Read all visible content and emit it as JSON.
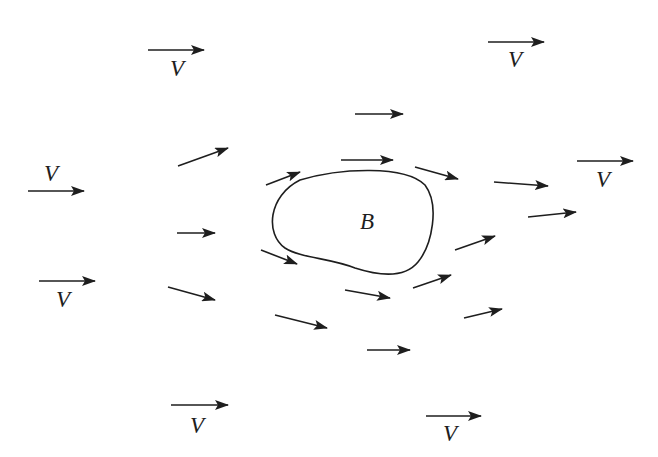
{
  "diagram": {
    "body_label": "B",
    "body_label_pos": [
      367,
      221
    ],
    "body_path": "M 300 180 C 340 168, 405 165, 425 185 C 440 205, 432 245, 418 262 C 405 278, 380 276, 355 268 C 330 258, 300 258, 285 248 C 265 234, 268 196, 300 180 Z",
    "colors": {
      "stroke": "#1e1e1e",
      "background": "#ffffff"
    },
    "free_stream_label": "V",
    "free_stream_vectors": [
      {
        "x1": 148,
        "y1": 50,
        "x2": 204,
        "y2": 50,
        "label_x": 177,
        "label_y": 68
      },
      {
        "x1": 488,
        "y1": 42,
        "x2": 544,
        "y2": 42,
        "label_x": 515,
        "label_y": 59
      },
      {
        "x1": 28,
        "y1": 191,
        "x2": 84,
        "y2": 191,
        "label_x": 51,
        "label_y": 173
      },
      {
        "x1": 577,
        "y1": 161,
        "x2": 633,
        "y2": 161,
        "label_x": 603,
        "label_y": 179
      },
      {
        "x1": 39,
        "y1": 281,
        "x2": 95,
        "y2": 281,
        "label_x": 63,
        "label_y": 299
      },
      {
        "x1": 171,
        "y1": 405,
        "x2": 228,
        "y2": 405,
        "label_x": 197,
        "label_y": 425
      },
      {
        "x1": 426,
        "y1": 416,
        "x2": 481,
        "y2": 416,
        "label_x": 450,
        "label_y": 433
      }
    ],
    "local_flow_vectors": [
      {
        "x1": 355,
        "y1": 114,
        "x2": 403,
        "y2": 114
      },
      {
        "x1": 178,
        "y1": 166,
        "x2": 228,
        "y2": 148
      },
      {
        "x1": 266,
        "y1": 185,
        "x2": 300,
        "y2": 172
      },
      {
        "x1": 341,
        "y1": 160,
        "x2": 393,
        "y2": 160
      },
      {
        "x1": 415,
        "y1": 167,
        "x2": 458,
        "y2": 179
      },
      {
        "x1": 494,
        "y1": 182,
        "x2": 548,
        "y2": 186
      },
      {
        "x1": 528,
        "y1": 217,
        "x2": 576,
        "y2": 212
      },
      {
        "x1": 177,
        "y1": 233,
        "x2": 215,
        "y2": 233
      },
      {
        "x1": 455,
        "y1": 250,
        "x2": 495,
        "y2": 236
      },
      {
        "x1": 261,
        "y1": 250,
        "x2": 297,
        "y2": 264
      },
      {
        "x1": 413,
        "y1": 288,
        "x2": 451,
        "y2": 275
      },
      {
        "x1": 168,
        "y1": 287,
        "x2": 215,
        "y2": 300
      },
      {
        "x1": 345,
        "y1": 290,
        "x2": 390,
        "y2": 298
      },
      {
        "x1": 275,
        "y1": 315,
        "x2": 327,
        "y2": 328
      },
      {
        "x1": 464,
        "y1": 318,
        "x2": 502,
        "y2": 309
      },
      {
        "x1": 367,
        "y1": 350,
        "x2": 410,
        "y2": 350
      }
    ]
  }
}
